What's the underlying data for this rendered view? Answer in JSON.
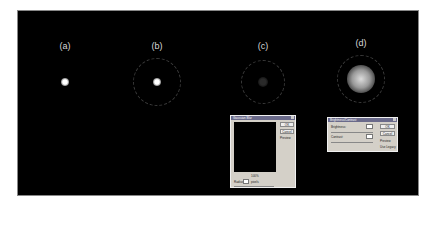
{
  "panels": [
    {
      "label": "(a)",
      "x": 65,
      "y": 41,
      "ring": null,
      "dot": {
        "x": 65,
        "y": 82,
        "r": 4,
        "color": "#ffffff",
        "glow": false
      }
    },
    {
      "label": "(b)",
      "x": 157,
      "y": 41,
      "ring": {
        "x": 157,
        "y": 82,
        "r": 24
      },
      "dot": {
        "x": 157,
        "y": 82,
        "r": 4,
        "color": "#ffffff",
        "glow": false
      }
    },
    {
      "label": "(c)",
      "x": 263,
      "y": 41,
      "ring": {
        "x": 263,
        "y": 82,
        "r": 22
      },
      "dot": {
        "x": 263,
        "y": 82,
        "r": 5,
        "color": "#2a2a2a",
        "glow": false
      }
    },
    {
      "label": "(d)",
      "x": 361,
      "y": 38,
      "ring": {
        "x": 361,
        "y": 79,
        "r": 24
      },
      "dot": {
        "x": 361,
        "y": 79,
        "r": 14,
        "color": "#dcdcdc",
        "glow": true
      }
    }
  ],
  "gaussian_dialog": {
    "title": "Gaussian Blur",
    "ok": "OK",
    "cancel": "Cancel",
    "preview": "Preview",
    "zoom": "100%",
    "radius_label": "Radius:",
    "radius_value": "",
    "unit": "pixels"
  },
  "brightness_dialog": {
    "title": "Brightness/Contrast",
    "brightness_label": "Brightness:",
    "brightness_value": "",
    "contrast_label": "Contrast:",
    "contrast_value": "",
    "ok": "OK",
    "cancel": "Cancel",
    "preview": "Preview",
    "legacy": "Use Legacy"
  }
}
